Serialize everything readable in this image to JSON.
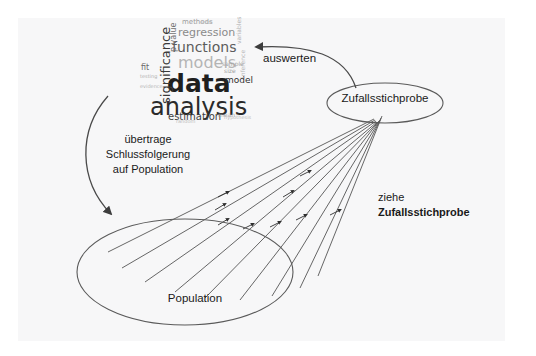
{
  "diagram": {
    "background_color": "#ffffff",
    "panel_color": "#f7f7f8",
    "line_color": "#4a4a4a",
    "text_color": "#1a1a1a"
  },
  "nodes": {
    "population": {
      "label": "Population",
      "shape": "ellipse",
      "cx": 185,
      "cy": 272,
      "rx": 108,
      "ry": 53
    },
    "sample": {
      "label": "Zufallsstichprobe",
      "shape": "ellipse",
      "cx": 385,
      "cy": 103,
      "rx": 58,
      "ry": 20
    }
  },
  "edges": {
    "evaluate": {
      "label": "auswerten",
      "from": "sample",
      "to": "wordcloud",
      "style": "curved-arrow"
    },
    "transfer": {
      "label": "übertrage\nSchlussfolgerung\nauf Population",
      "line1": "übertrage",
      "line2": "Schlussfolgerung",
      "line3": "auf Population",
      "from": "wordcloud",
      "to": "population",
      "style": "curved-arrow"
    },
    "draw": {
      "label_line1": "ziehe",
      "label_line2": "Zufallsstichprobe",
      "from": "population",
      "to": "sample",
      "style": "multiple-converging-arrows",
      "count": 9
    }
  },
  "wordcloud": {
    "name": "data-analysis-word-cloud",
    "words": [
      {
        "text": "data",
        "x": 27,
        "y": 55,
        "size": 25,
        "color": "#1f1f1f",
        "weight": "bold",
        "rotate": 0,
        "opacity": 1
      },
      {
        "text": "analysis",
        "x": 10,
        "y": 79,
        "size": 24,
        "color": "#2a2a2a",
        "weight": "normal",
        "rotate": 0,
        "opacity": 1
      },
      {
        "text": "models",
        "x": 38,
        "y": 39,
        "size": 16,
        "color": "#b4b4b4",
        "weight": "normal",
        "rotate": 0,
        "opacity": 1
      },
      {
        "text": "functions",
        "x": 32,
        "y": 24,
        "size": 14,
        "color": "#5c5c5c",
        "weight": "normal",
        "rotate": 0,
        "opacity": 1
      },
      {
        "text": "regression",
        "x": 38,
        "y": 11,
        "size": 11,
        "color": "#8a8a8a",
        "weight": "normal",
        "rotate": 0,
        "opacity": 1
      },
      {
        "text": "significance",
        "x": 19,
        "y": 88,
        "size": 13,
        "color": "#3a3a3a",
        "weight": "normal",
        "rotate": -90,
        "opacity": 1
      },
      {
        "text": "estimation",
        "x": 28,
        "y": 96,
        "size": 10,
        "color": "#3f3f3f",
        "weight": "normal",
        "rotate": 0,
        "opacity": 1
      },
      {
        "text": "methods",
        "x": 42,
        "y": 3,
        "size": 7,
        "color": "#9a9a9a",
        "weight": "normal",
        "rotate": 0,
        "opacity": 1
      },
      {
        "text": "p value",
        "x": 30,
        "y": 36,
        "size": 8,
        "color": "#6f6f6f",
        "weight": "normal",
        "rotate": -90,
        "opacity": 1
      },
      {
        "text": "model",
        "x": 85,
        "y": 60,
        "size": 9,
        "color": "#2f2f2f",
        "weight": "normal",
        "rotate": 0,
        "opacity": 1
      },
      {
        "text": "sample",
        "x": 82,
        "y": 45,
        "size": 6,
        "color": "#9f9f9f",
        "weight": "normal",
        "rotate": 0,
        "opacity": 1
      },
      {
        "text": "size",
        "x": 84,
        "y": 52,
        "size": 6,
        "color": "#9f9f9f",
        "weight": "normal",
        "rotate": 0,
        "opacity": 1
      },
      {
        "text": "fit",
        "x": 1,
        "y": 48,
        "size": 8,
        "color": "#6a6a6a",
        "weight": "normal",
        "rotate": 0,
        "opacity": 1
      },
      {
        "text": "testing",
        "x": 0,
        "y": 58,
        "size": 5,
        "color": "#b0b0b0",
        "weight": "normal",
        "rotate": 0,
        "opacity": 1
      },
      {
        "text": "evidence",
        "x": 0,
        "y": 68,
        "size": 5,
        "color": "#b6b6b6",
        "weight": "normal",
        "rotate": 0,
        "opacity": 1
      },
      {
        "text": "variables",
        "x": 96,
        "y": 28,
        "size": 6,
        "color": "#b0b0b0",
        "weight": "normal",
        "rotate": -90,
        "opacity": 1
      },
      {
        "text": "inference",
        "x": 100,
        "y": 62,
        "size": 6,
        "color": "#b8b8b8",
        "weight": "normal",
        "rotate": -90,
        "opacity": 1
      },
      {
        "text": "mean",
        "x": 78,
        "y": 96,
        "size": 6,
        "color": "#a8a8a8",
        "weight": "normal",
        "rotate": 0,
        "opacity": 1
      },
      {
        "text": "hypothesis",
        "x": 84,
        "y": 99,
        "size": 5,
        "color": "#bcbcbc",
        "weight": "normal",
        "rotate": 0,
        "opacity": 1
      },
      {
        "text": "random",
        "x": 36,
        "y": 103,
        "size": 5,
        "color": "#bcbcbc",
        "weight": "normal",
        "rotate": 0,
        "opacity": 1
      },
      {
        "text": "error",
        "x": 60,
        "y": 4,
        "size": 5,
        "color": "#c0c0c0",
        "weight": "normal",
        "rotate": 0,
        "opacity": 1
      }
    ]
  }
}
